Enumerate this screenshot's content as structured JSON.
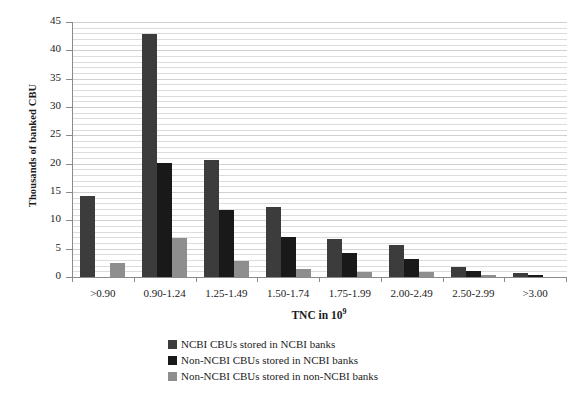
{
  "chart_data": {
    "type": "bar",
    "title": "",
    "xlabel": "TNC in 10⁹",
    "ylabel": "Thousands of banked CBU",
    "ylim": [
      0,
      45
    ],
    "ytick_step": 5,
    "yticks": [
      "0",
      "5",
      "10",
      "15",
      "20",
      "25",
      "30",
      "35",
      "40",
      "45"
    ],
    "grid": true,
    "grid_orientation": "horizontal",
    "legend_position": "bottom-center",
    "categories": [
      ">0.90",
      "0.90-1.24",
      "1.25-1.49",
      "1.50-1.74",
      "1.75-1.99",
      "2.00-2.49",
      "2.50-2.99",
      ">3.00"
    ],
    "series": [
      {
        "name": "NCBI CBUs stored in NCBI banks",
        "color": "#3c3c3c",
        "values": [
          14.3,
          42.9,
          20.7,
          12.4,
          6.7,
          5.7,
          1.7,
          0.7
        ]
      },
      {
        "name": "Non-NCBI CBUs stored in NCBI banks",
        "color": "#191919",
        "values": [
          0.0,
          20.2,
          11.8,
          7.0,
          4.2,
          3.2,
          1.0,
          0.3
        ]
      },
      {
        "name": "Non-NCBI CBUs stored in non-NCBI banks",
        "color": "#8e8e8e",
        "values": [
          2.4,
          6.9,
          2.9,
          1.5,
          0.8,
          0.8,
          0.3,
          0.0
        ]
      }
    ]
  },
  "axis": {
    "x_title_main": "TNC in 10",
    "x_title_exp": "9"
  }
}
